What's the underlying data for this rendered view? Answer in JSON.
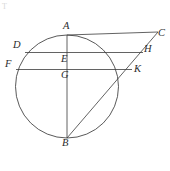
{
  "figure": {
    "kind": "geometry-diagram",
    "background_color": "#ffffff",
    "stroke_color": "#3b3b3b",
    "label_color": "#2c2c2c",
    "width": 170,
    "height": 171,
    "corner_artifact": "T",
    "circle": {
      "center_x": 67,
      "center_y": 86.5,
      "radius": 51.5
    },
    "points": [
      {
        "id": "A",
        "label": "A",
        "x": 67,
        "y": 35,
        "label_x": 63,
        "label_y": 21
      },
      {
        "id": "C",
        "label": "C",
        "x": 158,
        "y": 32,
        "label_x": 158,
        "label_y": 28
      },
      {
        "id": "D",
        "label": "D",
        "x": 25,
        "y": 52.5,
        "label_x": 13,
        "label_y": 40
      },
      {
        "id": "E",
        "label": "E",
        "x": 67,
        "y": 52.5,
        "label_x": 61,
        "label_y": 54
      },
      {
        "id": "F",
        "label": "F",
        "x": 16,
        "y": 69.5,
        "label_x": 5,
        "label_y": 59
      },
      {
        "id": "G",
        "label": "G",
        "x": 67,
        "y": 69.5,
        "label_x": 61,
        "label_y": 70
      },
      {
        "id": "H",
        "label": "H",
        "x": 143,
        "y": 52.5,
        "label_x": 144,
        "label_y": 44
      },
      {
        "id": "K",
        "label": "K",
        "x": 132,
        "y": 69.5,
        "label_x": 134,
        "label_y": 64
      },
      {
        "id": "B",
        "label": "B",
        "x": 67,
        "y": 138,
        "label_x": 62,
        "label_y": 138
      }
    ],
    "segments": [
      {
        "name": "segment-AC",
        "from": "A",
        "to": "C"
      },
      {
        "name": "segment-AB",
        "from": "A",
        "to": "B"
      },
      {
        "name": "segment-BC",
        "from": "B",
        "to": "C"
      },
      {
        "name": "segment-DH",
        "from": "D",
        "to": "H"
      },
      {
        "name": "segment-FK-extended",
        "from": "F",
        "to": "K"
      }
    ]
  }
}
